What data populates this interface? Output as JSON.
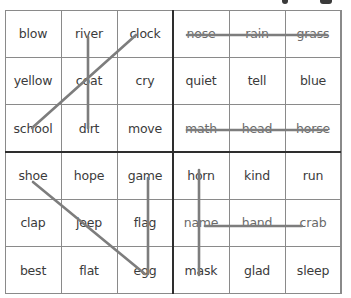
{
  "header": {
    "partial_title_glyphs": [
      ",",
      "g"
    ]
  },
  "board": {
    "quadrants": [
      {
        "id": "top-left",
        "cells": [
          "blow",
          "river",
          "clock",
          "yellow",
          "coat",
          "cry",
          "school",
          "dirt",
          "move"
        ]
      },
      {
        "id": "top-right",
        "cells": [
          "nose",
          "rain",
          "grass",
          "quiet",
          "tell",
          "blue",
          "math",
          "head",
          "horse"
        ]
      },
      {
        "id": "bottom-left",
        "cells": [
          "shoe",
          "hope",
          "game",
          "clap",
          "jeep",
          "flag",
          "best",
          "flat",
          "egg"
        ]
      },
      {
        "id": "bottom-right",
        "cells": [
          "horn",
          "kind",
          "run",
          "name",
          "hand",
          "crab",
          "mask",
          "glad",
          "sleep"
        ]
      }
    ],
    "crossed_lines": [
      {
        "quadrant": "top-left",
        "words": [
          "clock",
          "coat",
          "school"
        ],
        "x1": 136,
        "y1": 35,
        "x2": 32,
        "y2": 128
      },
      {
        "quadrant": "top-left",
        "words": [
          "river",
          "coat",
          "dirt"
        ],
        "x1": 88,
        "y1": 37,
        "x2": 88,
        "y2": 128
      },
      {
        "quadrant": "top-right",
        "words": [
          "nose",
          "rain",
          "grass"
        ],
        "x1": 187,
        "y1": 35,
        "x2": 327,
        "y2": 35
      },
      {
        "quadrant": "top-right",
        "words": [
          "math",
          "head",
          "horse"
        ],
        "x1": 187,
        "y1": 130,
        "x2": 327,
        "y2": 130
      },
      {
        "quadrant": "bottom-left",
        "words": [
          "shoe",
          "jeep",
          "egg"
        ],
        "x1": 33,
        "y1": 182,
        "x2": 145,
        "y2": 274
      },
      {
        "quadrant": "bottom-left",
        "words": [
          "game",
          "flag",
          "egg"
        ],
        "x1": 148,
        "y1": 178,
        "x2": 148,
        "y2": 274
      },
      {
        "quadrant": "bottom-right",
        "words": [
          "horn",
          "name",
          "mask"
        ],
        "x1": 199,
        "y1": 170,
        "x2": 199,
        "y2": 275
      },
      {
        "quadrant": "bottom-right",
        "words": [
          "name",
          "hand",
          "crab"
        ],
        "x1": 205,
        "y1": 226,
        "x2": 302,
        "y2": 226
      }
    ],
    "line_color": "#7d7d7d",
    "grid_color": "#8a8a8a",
    "divider_color": "#2e2e2e",
    "text_color": "#3b3b3b"
  }
}
